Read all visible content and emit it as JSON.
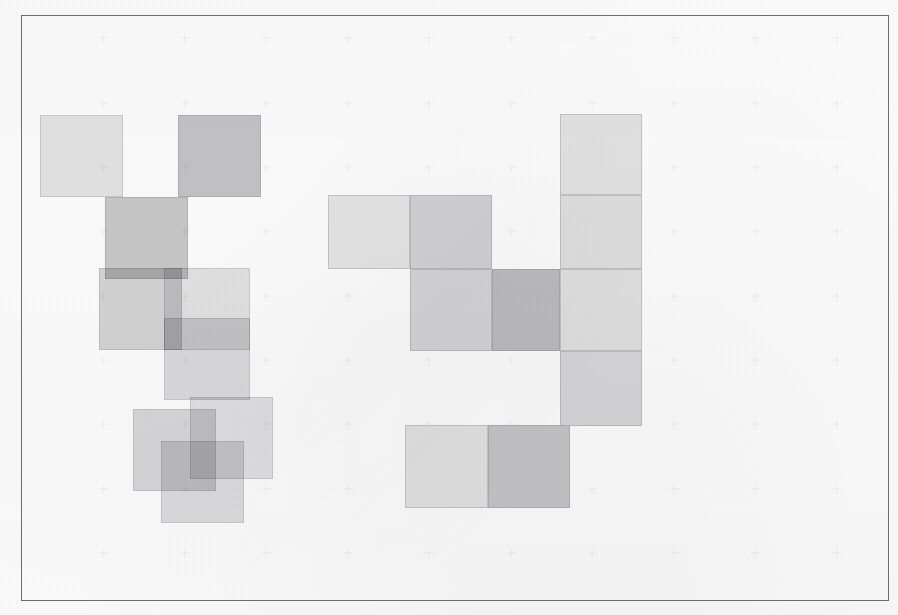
{
  "figure": {
    "title": "",
    "caption": "",
    "background_color": "#fefefe",
    "frame": {
      "x": 21,
      "y": 15,
      "width": 868,
      "height": 586,
      "border_color": "#6e6e74",
      "border_width": 1.3
    },
    "grid": {
      "visible": true,
      "marker": "plus-cross",
      "color": "#f0f0f2",
      "size": 9,
      "x_positions": [
        103,
        185,
        266,
        348,
        429,
        511,
        592,
        674,
        755,
        837
      ],
      "y_positions": [
        38,
        103,
        167,
        231,
        296,
        360,
        424,
        489,
        553
      ]
    }
  },
  "chart_data": {
    "type": "heatmap",
    "title": "",
    "xlabel": "",
    "ylabel": "",
    "grid": true,
    "legend": null,
    "xlim": [
      21,
      889
    ],
    "ylim": [
      15,
      601
    ],
    "tile_size": 82,
    "palette": {
      "lightest": "#e9e9ea",
      "light": "#e2e2e3",
      "mid_light": "#d8d8d9",
      "mid": "#cccccd",
      "mid_dark": "#bfbfc1",
      "dark": "#b2b2b4",
      "darkest": "#a6a6a8"
    },
    "clusters": [
      {
        "name": "left-cluster",
        "overlapping": true,
        "tiles": [
          {
            "id": "L1",
            "x": 40,
            "y": 115,
            "w": 83,
            "h": 82,
            "gray": "#e2e2e3",
            "alpha": 0.88
          },
          {
            "id": "L2",
            "x": 178,
            "y": 115,
            "w": 83,
            "h": 82,
            "gray": "#c0c0c2",
            "alpha": 0.92
          },
          {
            "id": "L3",
            "x": 105,
            "y": 197,
            "w": 83,
            "h": 82,
            "gray": "#c4c4c6",
            "alpha": 0.9
          },
          {
            "id": "L4",
            "x": 99,
            "y": 268,
            "w": 83,
            "h": 82,
            "gray": "#cececf",
            "alpha": 0.85
          },
          {
            "id": "L5",
            "x": 164,
            "y": 268,
            "w": 86,
            "h": 82,
            "gray": "#dededf",
            "alpha": 0.82
          },
          {
            "id": "L6",
            "x": 164,
            "y": 318,
            "w": 86,
            "h": 82,
            "gray": "#d4d4d6",
            "alpha": 0.8
          },
          {
            "id": "L7",
            "x": 190,
            "y": 397,
            "w": 83,
            "h": 82,
            "gray": "#dcdcde",
            "alpha": 0.82
          },
          {
            "id": "L8",
            "x": 133,
            "y": 409,
            "w": 83,
            "h": 82,
            "gray": "#d0d0d2",
            "alpha": 0.8
          },
          {
            "id": "L9",
            "x": 161,
            "y": 441,
            "w": 83,
            "h": 82,
            "gray": "#d6d6d8",
            "alpha": 0.8
          }
        ]
      },
      {
        "name": "right-cluster",
        "overlapping": false,
        "tiles": [
          {
            "id": "R1",
            "x": 560,
            "y": 114,
            "w": 82,
            "h": 81,
            "gray": "#e4e4e5",
            "alpha": 1
          },
          {
            "id": "R2",
            "x": 328,
            "y": 195,
            "w": 82,
            "h": 74,
            "gray": "#e6e6e7",
            "alpha": 1
          },
          {
            "id": "R3",
            "x": 410,
            "y": 195,
            "w": 82,
            "h": 74,
            "gray": "#d3d3d5",
            "alpha": 1
          },
          {
            "id": "R4",
            "x": 560,
            "y": 195,
            "w": 82,
            "h": 74,
            "gray": "#e0e0e1",
            "alpha": 1
          },
          {
            "id": "R5",
            "x": 410,
            "y": 269,
            "w": 82,
            "h": 82,
            "gray": "#d6d6d8",
            "alpha": 1
          },
          {
            "id": "R6",
            "x": 492,
            "y": 269,
            "w": 68,
            "h": 82,
            "gray": "#bdbdbf",
            "alpha": 1
          },
          {
            "id": "R7",
            "x": 560,
            "y": 269,
            "w": 82,
            "h": 82,
            "gray": "#e1e1e2",
            "alpha": 1
          },
          {
            "id": "R8",
            "x": 560,
            "y": 351,
            "w": 82,
            "h": 75,
            "gray": "#d8d8da",
            "alpha": 1
          },
          {
            "id": "R9",
            "x": 405,
            "y": 425,
            "w": 83,
            "h": 83,
            "gray": "#e3e3e4",
            "alpha": 1
          },
          {
            "id": "R10",
            "x": 488,
            "y": 425,
            "w": 82,
            "h": 83,
            "gray": "#c6c6c8",
            "alpha": 1
          }
        ]
      }
    ]
  }
}
